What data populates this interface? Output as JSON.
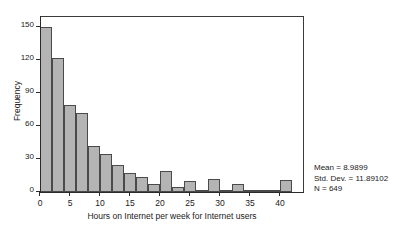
{
  "chart_data": {
    "type": "bar",
    "title": "",
    "xlabel": "Hours on Internet per week for Internet users",
    "ylabel": "Frequency",
    "xlim": [
      0,
      44
    ],
    "ylim": [
      0,
      160
    ],
    "grid": false,
    "legend": null,
    "bin_width": 2,
    "bin_starts": [
      0,
      2,
      4,
      6,
      8,
      10,
      12,
      14,
      16,
      18,
      20,
      22,
      24,
      26,
      28,
      30,
      32,
      34,
      36,
      38,
      40
    ],
    "categories": [
      "0-2",
      "2-4",
      "4-6",
      "6-8",
      "8-10",
      "10-12",
      "12-14",
      "14-16",
      "16-18",
      "18-20",
      "20-22",
      "22-24",
      "24-26",
      "26-28",
      "28-30",
      "30-32",
      "32-34",
      "34-36",
      "36-38",
      "38-40",
      "40-42"
    ],
    "values": [
      150,
      122,
      79,
      72,
      42,
      35,
      25,
      17,
      14,
      7,
      19,
      5,
      10,
      2,
      12,
      1,
      7,
      1,
      1,
      1,
      11
    ],
    "xticks": [
      {
        "value": 0,
        "label": "0"
      },
      {
        "value": 5,
        "label": "5"
      },
      {
        "value": 10,
        "label": "10"
      },
      {
        "value": 15,
        "label": "15"
      },
      {
        "value": 20,
        "label": "20"
      },
      {
        "value": 25,
        "label": "25"
      },
      {
        "value": 30,
        "label": "30"
      },
      {
        "value": 35,
        "label": "35"
      },
      {
        "value": 40,
        "label": "40"
      }
    ],
    "yticks": [
      {
        "value": 0,
        "label": "0"
      },
      {
        "value": 30,
        "label": "30"
      },
      {
        "value": 60,
        "label": "60"
      },
      {
        "value": 90,
        "label": "90"
      },
      {
        "value": 120,
        "label": "120"
      },
      {
        "value": 150,
        "label": "150"
      }
    ],
    "bar_fill_color": "#b4b4b4",
    "bar_edge_color": "#4a4a4a",
    "annotations": {
      "mean_line": "Mean = 8.9899",
      "std_dev_line": "Std. Dev. = 11.89102",
      "n_line": "N = 649"
    }
  }
}
